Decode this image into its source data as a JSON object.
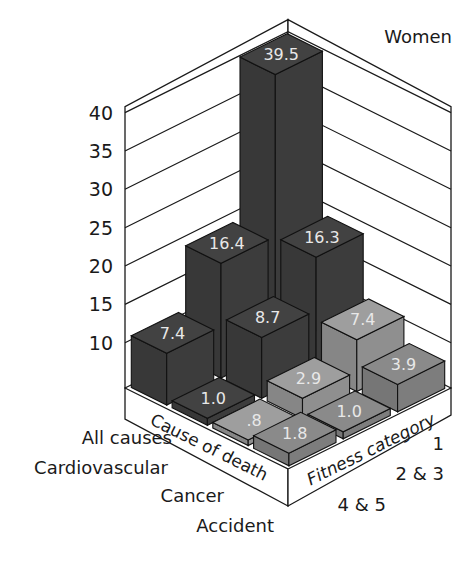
{
  "chart_data": {
    "type": "bar",
    "subtype": "3d-isometric-grouped-bar",
    "title": "Women",
    "ylabel": "",
    "ylim": [
      10,
      40
    ],
    "yticks": [
      10,
      15,
      20,
      25,
      30,
      35,
      40
    ],
    "grid": true,
    "axis_titles": {
      "cause": "Cause of death",
      "fitness": "Fitness category"
    },
    "causes": [
      "All causes",
      "Cardiovascular",
      "Cancer",
      "Accident"
    ],
    "fitness_categories": [
      "1",
      "2 & 3",
      "4 & 5"
    ],
    "series": [
      {
        "name": "All causes",
        "values": [
          39.5,
          16.4,
          7.4
        ],
        "labels": [
          "39.5",
          "16.4",
          "7.4"
        ],
        "color": "#3d3d3d"
      },
      {
        "name": "Cardiovascular",
        "values": [
          16.3,
          8.7,
          1.0
        ],
        "labels": [
          "16.3",
          "8.7",
          "1.0"
        ],
        "color": "#3d3d3d"
      },
      {
        "name": "Cancer",
        "values": [
          7.4,
          2.9,
          0.8
        ],
        "labels": [
          "7.4",
          "2.9",
          ".8"
        ],
        "color": "#929292"
      },
      {
        "name": "Accident",
        "values": [
          3.9,
          1.0,
          1.8
        ],
        "labels": [
          "3.9",
          "1.0",
          "1.8"
        ],
        "color": "#808080"
      }
    ]
  }
}
